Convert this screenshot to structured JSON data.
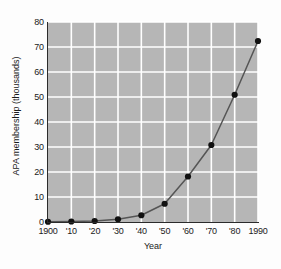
{
  "chart_data": {
    "type": "line",
    "title": "",
    "xlabel": "Year",
    "ylabel": "APA membership (thousands)",
    "x": [
      1900,
      1910,
      1920,
      1930,
      1940,
      1950,
      1960,
      1970,
      1980,
      1990
    ],
    "xtick_labels": [
      "1900",
      "'10",
      "'20",
      "'30",
      "'40",
      "'50",
      "'60",
      "'70",
      "'80",
      "1990"
    ],
    "ytick_labels": [
      "0",
      "10",
      "20",
      "30",
      "40",
      "50",
      "60",
      "70",
      "80"
    ],
    "ytick_values": [
      0,
      10,
      20,
      30,
      40,
      50,
      60,
      70,
      80
    ],
    "values": [
      0.1,
      0.2,
      0.4,
      1.1,
      2.7,
      7.3,
      18.2,
      30.8,
      50.9,
      72.4
    ],
    "series": [
      {
        "name": "APA membership (thousands)",
        "values": [
          0.1,
          0.2,
          0.4,
          1.1,
          2.7,
          7.3,
          18.2,
          30.8,
          50.9,
          72.4
        ]
      }
    ],
    "xlim": [
      1900,
      1990
    ],
    "ylim": [
      0,
      80
    ],
    "grid": true,
    "legend": "none",
    "colors": {
      "plot_background": "#b6b6b6",
      "figure_background": "#fdfdfd",
      "gridline": "#ffffff",
      "line": "#555555",
      "marker": "#111111",
      "axis": "#2b2b2b",
      "text": "#1a1a1a"
    }
  }
}
